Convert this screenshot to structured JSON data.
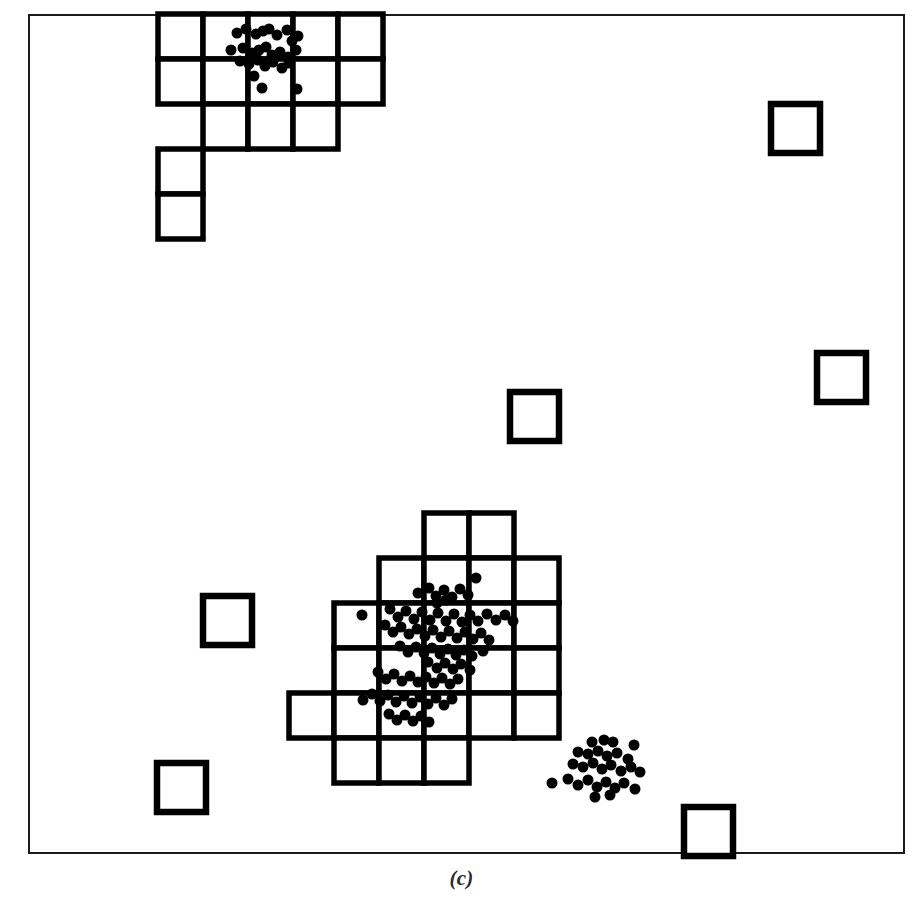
{
  "figure": {
    "caption": "(c)",
    "panel_label": "(c)",
    "frame": {
      "x": 28,
      "y": 14,
      "width": 877,
      "height": 840,
      "border_color": "#1b1b1b",
      "border_width": 2
    },
    "canvas": {
      "width": 923,
      "height": 918,
      "background": "#ffffff"
    }
  },
  "style": {
    "cell_fill": "#ffffff",
    "cell_stroke": "#000000",
    "cell_stroke_width": 5.5,
    "outlier_stroke": "#000000",
    "outlier_stroke_width": 6.5,
    "point_color": "#000000",
    "point_radius": 5.5
  },
  "chart_data": {
    "type": "scatter",
    "title": "(c)",
    "subtitle": "",
    "xlabel": "",
    "ylabel": "",
    "xlim": [
      28,
      905
    ],
    "ylim": [
      14,
      854
    ],
    "grid": false,
    "legend": null,
    "series": [
      {
        "name": "cluster-top-left-points",
        "kind": "points",
        "count": 28,
        "bbox": [
          228,
          24,
          308,
          96
        ],
        "points": [
          [
            237,
            33
          ],
          [
            246,
            29
          ],
          [
            256,
            34
          ],
          [
            263,
            31
          ],
          [
            269,
            29
          ],
          [
            277,
            35
          ],
          [
            287,
            30
          ],
          [
            292,
            41
          ],
          [
            298,
            36
          ],
          [
            231,
            50
          ],
          [
            243,
            48
          ],
          [
            252,
            53
          ],
          [
            259,
            50
          ],
          [
            266,
            47
          ],
          [
            272,
            55
          ],
          [
            280,
            52
          ],
          [
            288,
            57
          ],
          [
            296,
            50
          ],
          [
            240,
            61
          ],
          [
            249,
            64
          ],
          [
            258,
            60
          ],
          [
            265,
            66
          ],
          [
            273,
            62
          ],
          [
            282,
            68
          ],
          [
            289,
            63
          ],
          [
            254,
            76
          ],
          [
            262,
            88
          ],
          [
            297,
            89
          ]
        ]
      },
      {
        "name": "cluster-center-points",
        "kind": "points",
        "count": 86,
        "bbox": [
          352,
          570,
          500,
          730
        ],
        "points": [
          [
            476,
            578
          ],
          [
            418,
            593
          ],
          [
            429,
            588
          ],
          [
            436,
            596
          ],
          [
            444,
            590
          ],
          [
            452,
            597
          ],
          [
            460,
            589
          ],
          [
            468,
            595
          ],
          [
            437,
            603
          ],
          [
            446,
            600
          ],
          [
            362,
            615
          ],
          [
            390,
            609
          ],
          [
            398,
            617
          ],
          [
            406,
            611
          ],
          [
            414,
            619
          ],
          [
            422,
            612
          ],
          [
            430,
            620
          ],
          [
            438,
            613
          ],
          [
            446,
            621
          ],
          [
            454,
            614
          ],
          [
            462,
            622
          ],
          [
            470,
            615
          ],
          [
            478,
            621
          ],
          [
            487,
            614
          ],
          [
            496,
            620
          ],
          [
            505,
            615
          ],
          [
            513,
            621
          ],
          [
            385,
            625
          ],
          [
            393,
            632
          ],
          [
            401,
            627
          ],
          [
            409,
            634
          ],
          [
            417,
            629
          ],
          [
            425,
            636
          ],
          [
            433,
            630
          ],
          [
            441,
            637
          ],
          [
            449,
            631
          ],
          [
            457,
            638
          ],
          [
            465,
            632
          ],
          [
            473,
            639
          ],
          [
            481,
            633
          ],
          [
            489,
            640
          ],
          [
            400,
            646
          ],
          [
            408,
            652
          ],
          [
            416,
            647
          ],
          [
            424,
            653
          ],
          [
            432,
            648
          ],
          [
            440,
            654
          ],
          [
            448,
            649
          ],
          [
            456,
            655
          ],
          [
            464,
            650
          ],
          [
            472,
            656
          ],
          [
            483,
            651
          ],
          [
            428,
            662
          ],
          [
            437,
            668
          ],
          [
            445,
            663
          ],
          [
            453,
            669
          ],
          [
            461,
            664
          ],
          [
            470,
            670
          ],
          [
            378,
            672
          ],
          [
            386,
            679
          ],
          [
            394,
            674
          ],
          [
            402,
            681
          ],
          [
            410,
            676
          ],
          [
            418,
            682
          ],
          [
            426,
            677
          ],
          [
            434,
            683
          ],
          [
            442,
            678
          ],
          [
            450,
            684
          ],
          [
            458,
            679
          ],
          [
            363,
            700
          ],
          [
            372,
            694
          ],
          [
            380,
            701
          ],
          [
            388,
            695
          ],
          [
            396,
            702
          ],
          [
            404,
            696
          ],
          [
            412,
            703
          ],
          [
            420,
            697
          ],
          [
            428,
            704
          ],
          [
            436,
            698
          ],
          [
            444,
            705
          ],
          [
            452,
            699
          ],
          [
            389,
            714
          ],
          [
            397,
            720
          ],
          [
            405,
            715
          ],
          [
            413,
            721
          ],
          [
            421,
            716
          ],
          [
            429,
            722
          ]
        ]
      },
      {
        "name": "cluster-lower-right-points",
        "kind": "points",
        "count": 29,
        "bbox": [
          548,
          733,
          646,
          800
        ],
        "points": [
          [
            592,
            742
          ],
          [
            604,
            740
          ],
          [
            613,
            742
          ],
          [
            634,
            745
          ],
          [
            578,
            752
          ],
          [
            588,
            754
          ],
          [
            598,
            751
          ],
          [
            607,
            756
          ],
          [
            617,
            753
          ],
          [
            628,
            759
          ],
          [
            573,
            764
          ],
          [
            583,
            767
          ],
          [
            593,
            763
          ],
          [
            602,
            769
          ],
          [
            611,
            765
          ],
          [
            621,
            771
          ],
          [
            631,
            767
          ],
          [
            640,
            772
          ],
          [
            552,
            783
          ],
          [
            568,
            779
          ],
          [
            578,
            785
          ],
          [
            588,
            780
          ],
          [
            597,
            787
          ],
          [
            606,
            782
          ],
          [
            615,
            788
          ],
          [
            624,
            783
          ],
          [
            635,
            789
          ],
          [
            595,
            797
          ],
          [
            610,
            795
          ]
        ]
      }
    ],
    "grids": [
      {
        "name": "grid-top-left",
        "cell_size": 45,
        "origin": [
          158,
          14
        ],
        "occupied_cells": [
          [
            0,
            0
          ],
          [
            1,
            0
          ],
          [
            2,
            0
          ],
          [
            3,
            0
          ],
          [
            4,
            0
          ],
          [
            0,
            1
          ],
          [
            1,
            1
          ],
          [
            2,
            1
          ],
          [
            3,
            1
          ],
          [
            4,
            1
          ],
          [
            1,
            2
          ],
          [
            2,
            2
          ],
          [
            3,
            2
          ],
          [
            0,
            3
          ],
          [
            0,
            4
          ]
        ]
      },
      {
        "name": "grid-center",
        "cell_size": 45,
        "origin": [
          289,
          513
        ],
        "occupied_cells": [
          [
            3,
            0
          ],
          [
            4,
            0
          ],
          [
            2,
            1
          ],
          [
            3,
            1
          ],
          [
            4,
            1
          ],
          [
            5,
            1
          ],
          [
            1,
            2
          ],
          [
            2,
            2
          ],
          [
            3,
            2
          ],
          [
            4,
            2
          ],
          [
            5,
            2
          ],
          [
            1,
            3
          ],
          [
            2,
            3
          ],
          [
            3,
            3
          ],
          [
            4,
            3
          ],
          [
            5,
            3
          ],
          [
            0,
            4
          ],
          [
            1,
            4
          ],
          [
            2,
            4
          ],
          [
            3,
            4
          ],
          [
            4,
            4
          ],
          [
            5,
            4
          ],
          [
            1,
            5
          ],
          [
            2,
            5
          ],
          [
            3,
            5
          ]
        ]
      }
    ],
    "outlier_cells": [
      {
        "name": "outlier-top-right",
        "x": 771,
        "y": 104,
        "size": 49
      },
      {
        "name": "outlier-right-upper",
        "x": 817,
        "y": 353,
        "size": 49
      },
      {
        "name": "outlier-center",
        "x": 510,
        "y": 392,
        "size": 49
      },
      {
        "name": "outlier-left-middle",
        "x": 203,
        "y": 596,
        "size": 49
      },
      {
        "name": "outlier-bottom-left",
        "x": 157,
        "y": 763,
        "size": 49
      },
      {
        "name": "outlier-bottom-right",
        "x": 684,
        "y": 807,
        "size": 49
      }
    ]
  }
}
